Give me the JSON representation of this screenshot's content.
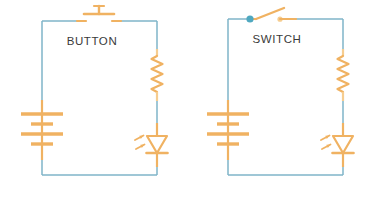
{
  "diagram": {
    "type": "circuit-schematic",
    "background_color": "#ffffff",
    "wire_color": "#7fb5c8",
    "component_color": "#f0b262",
    "component_color_light": "#f6cd90",
    "node_color": "#4fa8c0",
    "label_color": "#3a3a3a",
    "circuits": [
      {
        "id": "button-circuit",
        "label": "BUTTON",
        "label_x": 92,
        "label_y": 45,
        "loop": {
          "left": 42,
          "right": 157,
          "top": 21,
          "bottom": 175
        },
        "components": [
          {
            "name": "pushbutton",
            "x": 99,
            "y": 21
          },
          {
            "name": "battery",
            "x": 42,
            "y": 130
          },
          {
            "name": "resistor",
            "x": 157,
            "y": 75
          },
          {
            "name": "led",
            "x": 157,
            "y": 145
          }
        ]
      },
      {
        "id": "switch-circuit",
        "label": "SWITCH",
        "label_x": 277,
        "label_y": 43,
        "loop": {
          "left": 228,
          "right": 343,
          "top": 19,
          "bottom": 175
        },
        "components": [
          {
            "name": "switch",
            "x": 272,
            "y": 19
          },
          {
            "name": "battery",
            "x": 228,
            "y": 130
          },
          {
            "name": "resistor",
            "x": 343,
            "y": 75
          },
          {
            "name": "led",
            "x": 343,
            "y": 145
          }
        ]
      }
    ],
    "battery": {
      "plate_widths": [
        42,
        22,
        42,
        22
      ],
      "plate_spacing": 10,
      "plate_thickness": 3.2
    },
    "resistor": {
      "zigzag_peaks": 7,
      "amplitude": 5.5,
      "height": 38
    },
    "led": {
      "triangle_width": 20,
      "triangle_height": 17,
      "emission_arrows": 2
    }
  }
}
